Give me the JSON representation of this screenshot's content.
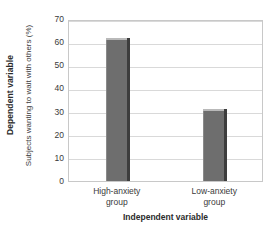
{
  "chart_data": {
    "type": "bar",
    "title": "",
    "categories": [
      "High-anxiety group",
      "Low-anxiety group"
    ],
    "category_lines": [
      [
        "High-anxiety",
        "group"
      ],
      [
        "Low-anxiety",
        "group"
      ]
    ],
    "values": [
      62,
      31
    ],
    "xlabel": "Independent variable",
    "ylabel": "Subjects wanting to wait with others (%)",
    "ylabel_outer": "Dependent variable",
    "ylim": [
      0,
      70
    ],
    "ytick_values": [
      70,
      60,
      50,
      40,
      30,
      20,
      10,
      0
    ],
    "ytick_labels": [
      "70",
      "60",
      "50",
      "40",
      "30",
      "20",
      "10",
      "0"
    ],
    "grid": true,
    "legend": false,
    "bar_color": "#6e6e6e",
    "bar_shadow_color": "#3d3d3d",
    "bar_highlight_color": "#b9b9b9",
    "grid_color": "#d9d9d9",
    "frame_color": "#c8c8c8",
    "text_color": "#3a3a3a"
  }
}
